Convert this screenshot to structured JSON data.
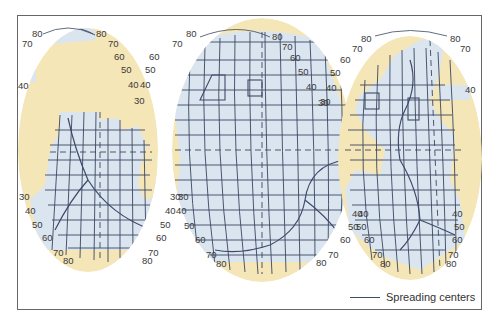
{
  "figure": {
    "colors": {
      "ocean": "#dbe5f0",
      "land": "#f5e6b8",
      "grid": "#3a4660",
      "ridge": "#3d4a6a",
      "frame": "#555555",
      "label": "#3a3a3a"
    },
    "lobes": [
      {
        "name": "indian-ocean-lobe",
        "left_labels": [
          "80",
          "70",
          "40",
          "30",
          "40",
          "50",
          "60",
          "70",
          "80"
        ],
        "right_labels": [
          "80",
          "70",
          "60",
          "50",
          "40",
          "30",
          "30",
          "40",
          "50",
          "60",
          "70",
          "80"
        ]
      },
      {
        "name": "pacific-ocean-lobe",
        "left_labels": [
          "80",
          "70",
          "60",
          "50",
          "40",
          "30",
          "30",
          "40",
          "50",
          "60",
          "70",
          "80"
        ],
        "right_labels": [
          "80",
          "70",
          "60",
          "50",
          "40",
          "30",
          "40",
          "50",
          "60",
          "70",
          "80"
        ]
      },
      {
        "name": "atlantic-ocean-lobe",
        "left_labels": [
          "80",
          "70",
          "60",
          "50",
          "40",
          "40",
          "50",
          "60",
          "70",
          "80"
        ],
        "right_labels": [
          "80",
          "70",
          "40",
          "40",
          "50",
          "60",
          "70",
          "80"
        ]
      }
    ]
  },
  "legend": {
    "spreading_centers_label": "Spreading centers"
  }
}
